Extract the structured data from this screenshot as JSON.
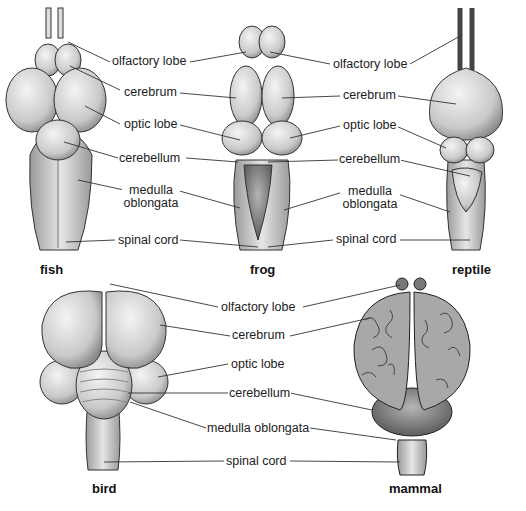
{
  "figure": {
    "panels": [
      {
        "animal": "fish",
        "labels": [
          "olfactory lobe",
          "cerebrum",
          "optic lobe",
          "cerebellum",
          "medulla oblongata",
          "spinal cord"
        ]
      },
      {
        "animal": "frog",
        "labels": [
          "olfactory lobe",
          "cerebrum",
          "optic lobe",
          "cerebellum",
          "medulla oblongata",
          "spinal cord"
        ]
      },
      {
        "animal": "reptile",
        "labels": [
          "olfactory lobe",
          "cerebrum",
          "optic lobe",
          "cerebellum",
          "medulla oblongata",
          "spinal cord"
        ]
      },
      {
        "animal": "bird",
        "labels": [
          "olfactory lobe",
          "cerebrum",
          "optic lobe",
          "cerebellum",
          "medulla oblongata",
          "spinal cord"
        ]
      },
      {
        "animal": "mammal",
        "labels": [
          "olfactory lobe",
          "cerebrum",
          "cerebellum",
          "medulla oblongata",
          "spinal cord"
        ]
      }
    ]
  },
  "top_labels_left": {
    "olfactory": "olfactory lobe",
    "cerebrum": "cerebrum",
    "optic": "optic lobe",
    "cerebellum": "cerebellum",
    "medulla1": "medulla",
    "medulla2": "oblongata",
    "spinal": "spinal cord"
  },
  "top_labels_right": {
    "olfactory": "olfactory lobe",
    "cerebrum": "cerebrum",
    "optic": "optic lobe",
    "cerebellum": "cerebellum",
    "medulla1": "medulla",
    "medulla2": "oblongata",
    "spinal": "spinal cord"
  },
  "bottom_labels": {
    "olfactory": "olfactory lobe",
    "cerebrum": "cerebrum",
    "optic": "optic lobe",
    "cerebellum": "cerebellum",
    "medulla": "medulla oblongata",
    "spinal": "spinal cord"
  },
  "captions": {
    "fish": "fish",
    "frog": "frog",
    "reptile": "reptile",
    "bird": "bird",
    "mammal": "mammal"
  }
}
